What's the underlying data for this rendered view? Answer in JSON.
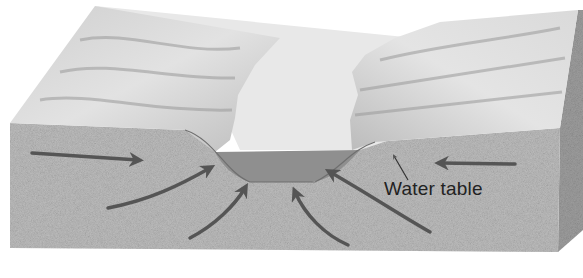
{
  "diagram": {
    "type": "cross-section block diagram",
    "labels": {
      "water_table": "Water table"
    },
    "colors": {
      "background": "#ffffff",
      "land_surface": "#d6d6d6",
      "channel_floor": "#e6e6e6",
      "ground_front": "#b8b8b8",
      "ground_side": "#9a9a9a",
      "water": "#8f8f8f",
      "arrow": "#555555"
    },
    "arrows": [
      {
        "id": "left-horizontal",
        "direction": "right"
      },
      {
        "id": "left-curve-upper",
        "direction": "up-right"
      },
      {
        "id": "left-curve-lower",
        "direction": "up-right"
      },
      {
        "id": "right-curve-lower",
        "direction": "up-left"
      },
      {
        "id": "right-curve-upper",
        "direction": "up-left"
      },
      {
        "id": "right-horizontal",
        "direction": "left"
      }
    ]
  }
}
